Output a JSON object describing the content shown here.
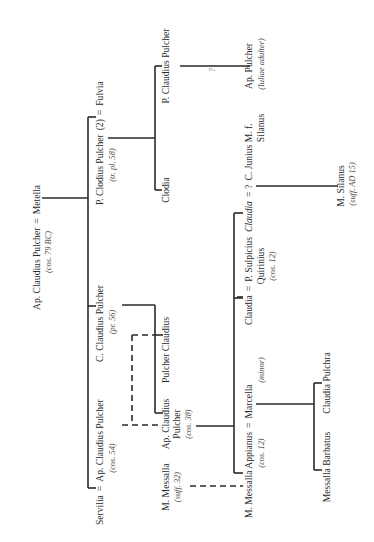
{
  "orientation": "rotated 90 degrees counter-clockwise (text reads bottom-to-top)",
  "people": {
    "ap_claudius_sr": {
      "name": "Ap. Claudius Pulcher",
      "note": "(cos. 79 BC)"
    },
    "metella": {
      "name": "Metella"
    },
    "servilia": {
      "name": "Servilia"
    },
    "ap_claudius_54": {
      "name": "Ap. Claudius Pulcher",
      "note": "(cos. 54)"
    },
    "c_claudius": {
      "name": "C. Claudius Pulcher",
      "note": "(pr. 56)"
    },
    "p_clodius": {
      "name": "P. Clodius Pulcher",
      "marriage_no": "(2)",
      "note": "(tr. pl. 58)"
    },
    "fulvia": {
      "name": "Fulvia"
    },
    "clodia": {
      "name": "Clodia"
    },
    "p_claudius": {
      "name": "P. Claudius Pulcher"
    },
    "ap_pulcher": {
      "name": "Ap. Pulcher",
      "note": "(Iuliae adulter)"
    },
    "m_messalla": {
      "name": "M. Messalla",
      "note": "(suff. 32)"
    },
    "ap_claudius_38": {
      "name_line1": "Ap. Claudius",
      "name_line2": "Pulcher",
      "note": "(cos. 38)"
    },
    "pulcher_claudius": {
      "name": "Pulcher Claudius"
    },
    "m_messalla_appianus": {
      "name": "M. Messalla Appianus",
      "note": "(cos. 12)"
    },
    "marcella": {
      "name": "Marcella",
      "note": "(minor)"
    },
    "claudia": {
      "name": "Claudia"
    },
    "p_sulpicius": {
      "name_line1": "P. Sulpicius",
      "name_line2": "Quirinius",
      "note": "(cos. 12)"
    },
    "claudia_2": {
      "name": "Claudia"
    },
    "unknown": {
      "name": "?"
    },
    "c_junius": {
      "name_line1": "C. Junius M. f.",
      "name_line2": "Silanus"
    },
    "m_silanus": {
      "name": "M. Silanus",
      "note": "(suff. AD 15)"
    },
    "messalla_barbatus": {
      "name": "Messalla Barbatus"
    },
    "claudia_pulchra": {
      "name": "Claudia Pulchra"
    }
  },
  "symbols": {
    "marriage": "=",
    "uncertain": "?"
  },
  "line_styles": {
    "descent": "solid",
    "adoption": "dashed"
  },
  "colors": {
    "ink": "#2a2a2a",
    "background": "#ffffff"
  }
}
